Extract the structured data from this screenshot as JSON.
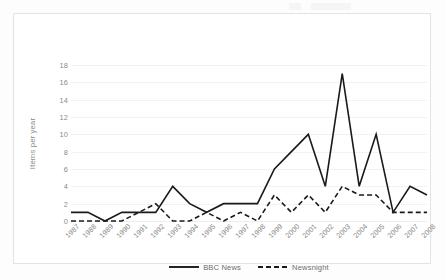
{
  "figure": {
    "background_color": "#fdfdfd",
    "frame_color": "#e3e3e3"
  },
  "chart_data": {
    "type": "line",
    "title": "",
    "subtitle": "",
    "xlabel": "",
    "ylabel": "Items per year",
    "ylim": [
      0,
      18
    ],
    "ytick_step": 2,
    "yticks": [
      0,
      2,
      4,
      6,
      8,
      10,
      12,
      14,
      16,
      18
    ],
    "grid": true,
    "grid_axis": "y",
    "legend_position": "bottom-center",
    "categories": [
      "1987",
      "1988",
      "1989",
      "1990",
      "1991",
      "1992",
      "1993",
      "1994",
      "1995",
      "1996",
      "1997",
      "1998",
      "1999",
      "2000",
      "2001",
      "2002",
      "2003",
      "2004",
      "2005",
      "2006",
      "2007",
      "2008"
    ],
    "series": [
      {
        "name": "BBC News",
        "style": "solid",
        "color": "#1a1a1a",
        "width": 1.6,
        "values": [
          1,
          1,
          0,
          1,
          1,
          1,
          4,
          2,
          1,
          2,
          2,
          2,
          6,
          8,
          10,
          4,
          17,
          4,
          10,
          1,
          4,
          3
        ]
      },
      {
        "name": "Newsnight",
        "style": "dashed",
        "color": "#1a1a1a",
        "width": 1.6,
        "values": [
          0,
          0,
          0,
          0,
          1,
          2,
          0,
          0,
          1,
          0,
          1,
          0,
          3,
          1,
          3,
          1,
          4,
          3,
          3,
          1,
          1,
          1
        ]
      }
    ]
  }
}
